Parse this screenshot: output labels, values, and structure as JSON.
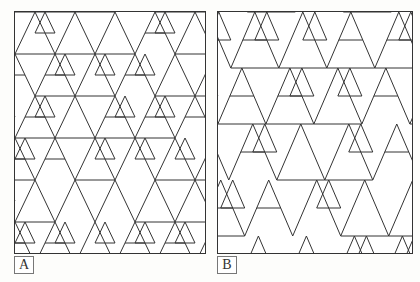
{
  "figure": {
    "panels": [
      {
        "id": "A",
        "label": "A",
        "x": 14,
        "y": 11,
        "w": 190,
        "h": 241,
        "tri_w": 40,
        "row_h": 21,
        "style": "aligned"
      },
      {
        "id": "B",
        "label": "B",
        "x": 217,
        "y": 11,
        "w": 194,
        "h": 241,
        "tri_w": 48,
        "row_h": 28,
        "style": "shifted"
      }
    ],
    "line_color": "#333333"
  }
}
